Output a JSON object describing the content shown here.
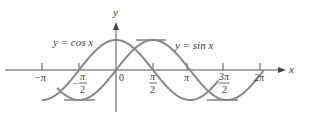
{
  "chart_data": {
    "type": "line",
    "title": "",
    "xlabel": "x",
    "ylabel": "y",
    "origin_label": "0",
    "series": [
      {
        "name": "y = cos x",
        "label": "y = cos x",
        "function": "cos",
        "color": "#888888"
      },
      {
        "name": "y = sin x",
        "label": "y = sin x",
        "function": "sin",
        "color": "#888888"
      }
    ],
    "x_ticks": [
      {
        "value": -3.14159,
        "label": "−π",
        "num": "",
        "den": ""
      },
      {
        "value": -1.5708,
        "label": "−π/2",
        "num": "π",
        "den": "2"
      },
      {
        "value": 1.5708,
        "label": "π/2",
        "num": "π",
        "den": "2"
      },
      {
        "value": 3.14159,
        "label": "π",
        "num": "",
        "den": ""
      },
      {
        "value": 4.7124,
        "label": "3π/2",
        "num": "3π",
        "den": "2"
      },
      {
        "value": 6.28318,
        "label": "2π",
        "num": "",
        "den": ""
      }
    ],
    "xlim": [
      -3.6,
      7.0
    ],
    "ylim": [
      -1.2,
      1.6
    ],
    "grid": false,
    "legend": "inline labels",
    "reference_lines": [
      {
        "description": "max of sin at π/2",
        "y": 1
      },
      {
        "description": "min of cos at −π/2... min of sin at 3π/2",
        "y": -1
      }
    ]
  }
}
